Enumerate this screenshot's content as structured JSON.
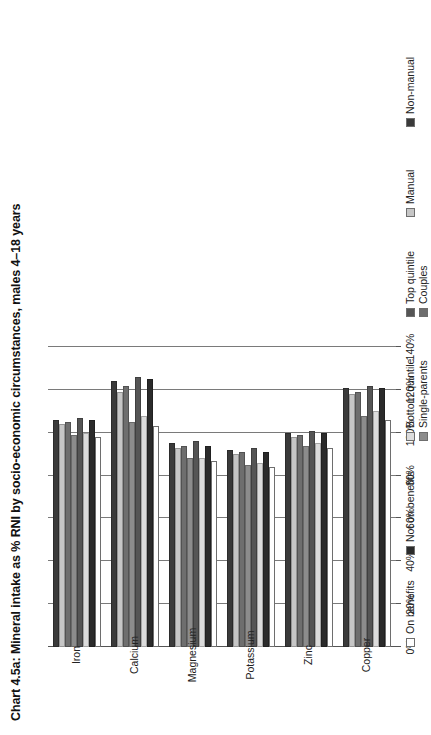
{
  "title": "Chart 4.5a: Mineral intake as % RNI by socio-economic circumstances, males 4–18 years",
  "axis": {
    "tick_labels": [
      "0%",
      "20%",
      "40%",
      "60%",
      "80%",
      "100%",
      "120%",
      "140%"
    ],
    "xlabel": "",
    "ylabel": ""
  },
  "legend": {
    "items": [
      {
        "label": "On benefits",
        "color": "#ffffff"
      },
      {
        "label": "Not on benefits",
        "color": "#2b2b2b"
      },
      {
        "label": "Bottom quintile",
        "color": "#dcdcdc"
      },
      {
        "label": "Top quintile",
        "color": "#555555"
      },
      {
        "label": "Single-parents",
        "color": "#8c8c8c"
      },
      {
        "label": "Couples",
        "color": "#6e6e6e"
      },
      {
        "label": "Manual",
        "color": "#c6c6c6"
      },
      {
        "label": "Non-manual",
        "color": "#3a3a3a"
      }
    ]
  },
  "chart_data": {
    "type": "bar",
    "orientation": "horizontal",
    "title": "Chart 4.5a: Mineral intake as % RNI by socio-economic circumstances, males 4–18 years",
    "xlabel": "",
    "ylabel": "",
    "xlim": [
      0,
      140
    ],
    "grid": true,
    "legend_position": "bottom",
    "categories": [
      "Iron",
      "Calcium",
      "Magnesium",
      "Potassium",
      "Zinc",
      "Copper"
    ],
    "series": [
      {
        "name": "On benefits",
        "color": "#ffffff",
        "values": [
          98,
          103,
          87,
          84,
          93,
          106
        ]
      },
      {
        "name": "Not on benefits",
        "color": "#2b2b2b",
        "values": [
          106,
          125,
          94,
          91,
          100,
          121
        ]
      },
      {
        "name": "Bottom quintile",
        "color": "#dcdcdc",
        "values": [
          100,
          108,
          88,
          86,
          95,
          110
        ]
      },
      {
        "name": "Top quintile",
        "color": "#555555",
        "values": [
          107,
          126,
          96,
          93,
          101,
          122
        ]
      },
      {
        "name": "Single-parents",
        "color": "#8c8c8c",
        "values": [
          99,
          105,
          88,
          85,
          94,
          108
        ]
      },
      {
        "name": "Couples",
        "color": "#6e6e6e",
        "values": [
          105,
          122,
          94,
          91,
          99,
          119
        ]
      },
      {
        "name": "Manual",
        "color": "#c6c6c6",
        "values": [
          104,
          119,
          93,
          90,
          98,
          118
        ]
      },
      {
        "name": "Non-manual",
        "color": "#3a3a3a",
        "values": [
          106,
          124,
          95,
          92,
          100,
          121
        ]
      }
    ]
  }
}
